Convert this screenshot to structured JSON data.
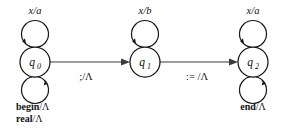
{
  "diagram": {
    "kind": "state-transition-diagram",
    "background_color": "#ffffff",
    "stroke_color": "#151515",
    "edge_color": "#3c3c3c",
    "states": [
      {
        "id": "q0",
        "name": "q",
        "subscript": "0",
        "cx": 35,
        "cy": 62,
        "r": 15,
        "top_loop_label": "x/a",
        "bottom_loop_labels": [
          "begin/Λ",
          "real/Λ"
        ]
      },
      {
        "id": "q1",
        "name": "q",
        "subscript": "1",
        "cx": 145,
        "cy": 62,
        "r": 15,
        "top_loop_label": "x/b",
        "bottom_loop_labels": []
      },
      {
        "id": "q2",
        "name": "q",
        "subscript": "2",
        "cx": 253,
        "cy": 62,
        "r": 15,
        "top_loop_label": "x/a",
        "bottom_loop_labels": [
          "end/Λ"
        ]
      }
    ],
    "transitions": [
      {
        "id": "t0",
        "from": "q0",
        "to": "q1",
        "label": ";/Λ"
      },
      {
        "id": "t1",
        "from": "q1",
        "to": "q2",
        "label": ":= /Λ"
      }
    ],
    "loop_labels": {
      "q0_top": "x/a",
      "q1_top": "x/b",
      "q2_top": "x/a",
      "q0_bottom_1": "begin",
      "q0_bottom_1_suffix": "/Λ",
      "q0_bottom_2": "real",
      "q0_bottom_2_suffix": "/Λ",
      "q2_bottom_1": "end",
      "q2_bottom_1_suffix": "/Λ"
    }
  }
}
